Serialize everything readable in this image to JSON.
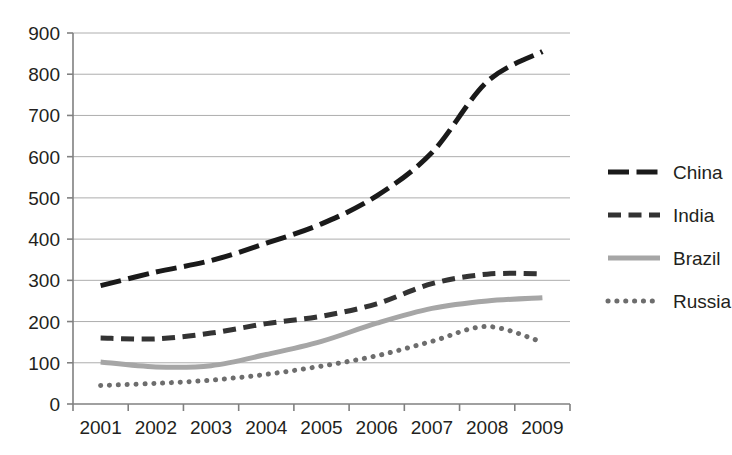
{
  "chart_data": {
    "type": "line",
    "title": "",
    "subtitle": "",
    "xlabel": "",
    "ylabel": "",
    "categories": [
      "2001",
      "2002",
      "2003",
      "2004",
      "2005",
      "2006",
      "2007",
      "2008",
      "2009"
    ],
    "x_tick_labels": [
      "2001",
      "2002",
      "2003",
      "2004",
      "2005",
      "2006",
      "2007",
      "2008",
      "2009"
    ],
    "y_tick_labels": [
      "0",
      "100",
      "200",
      "300",
      "400",
      "500",
      "600",
      "700",
      "800",
      "900"
    ],
    "y_ticks": [
      0,
      100,
      200,
      300,
      400,
      500,
      600,
      700,
      800,
      900
    ],
    "ylim": [
      0,
      900
    ],
    "grid": "horizontal",
    "legend_position": "right",
    "series": [
      {
        "name": "China",
        "style": "long-dash",
        "color": "#1a1a1a",
        "width": 5,
        "values": [
          287,
          320,
          348,
          390,
          437,
          505,
          610,
          782,
          855
        ]
      },
      {
        "name": "India",
        "style": "dash",
        "color": "#333333",
        "width": 5,
        "values": [
          160,
          158,
          172,
          195,
          213,
          243,
          292,
          315,
          316
        ]
      },
      {
        "name": "Brazil",
        "style": "solid",
        "color": "#a6a6a6",
        "width": 5,
        "values": [
          102,
          90,
          93,
          120,
          152,
          196,
          232,
          250,
          258
        ]
      },
      {
        "name": "Russia",
        "style": "dot",
        "color": "#6d6d6d",
        "width": 5,
        "values": [
          45,
          50,
          58,
          72,
          92,
          117,
          152,
          188,
          150
        ]
      }
    ]
  },
  "legend": {
    "entries": [
      {
        "label": "China"
      },
      {
        "label": "India"
      },
      {
        "label": "Brazil"
      },
      {
        "label": "Russia"
      }
    ]
  },
  "colors": {
    "axis": "#808080",
    "grid": "#aeaeae",
    "text": "#231f20",
    "china": "#1a1a1a",
    "india": "#333333",
    "brazil": "#a6a6a6",
    "russia": "#6d6d6d"
  }
}
